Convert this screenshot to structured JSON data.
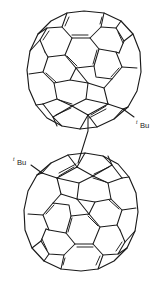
{
  "figure": {
    "name": "fullerene-dimer-structure",
    "type": "chemical-structure-diagram",
    "background_color": "#ffffff",
    "line_color": "#1a1a1a",
    "width": 165,
    "height": 281
  },
  "moieties": {
    "top_cage": {
      "name": "C60 fullerene cage (upper)",
      "center_x": 84,
      "center_y": 72,
      "radius_x": 57,
      "radius_y": 62
    },
    "bottom_cage": {
      "name": "C60 fullerene cage (lower)",
      "center_x": 81,
      "center_y": 210,
      "radius_x": 57,
      "radius_y": 62
    },
    "linker": {
      "name": "inter-cage single bond",
      "x1": 88,
      "y1": 131,
      "x2": 78,
      "y2": 163
    }
  },
  "labels": {
    "top_substituent": {
      "prefix": "t",
      "text": "Bu",
      "full": "tBu",
      "x": 140,
      "y": 130
    },
    "bottom_substituent": {
      "prefix": "t",
      "text": "Bu",
      "full": "tBu",
      "x": 17,
      "y": 167
    }
  }
}
